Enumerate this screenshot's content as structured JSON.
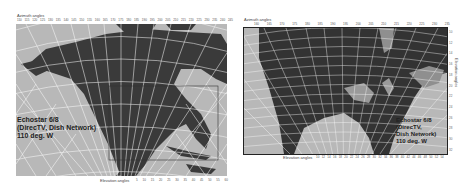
{
  "left_map": {
    "azimuth_title": "Azimuth angles",
    "azimuth_ticks": [
      "110",
      "115",
      "120",
      "125",
      "130",
      "135",
      "140",
      "145",
      "150",
      "155",
      "160",
      "165",
      "170",
      "175",
      "180",
      "185",
      "190",
      "195",
      "200",
      "205",
      "210",
      "215",
      "220",
      "225",
      "230",
      "235",
      "240",
      "245"
    ],
    "elevation_title": "Elevation angles",
    "elevation_ticks": [
      "5",
      "10",
      "15",
      "20",
      "25",
      "30",
      "35",
      "40",
      "45",
      "50",
      "55",
      "60"
    ],
    "label": {
      "line1": "Echostar 6/8",
      "line2": "(DirecTV, Dish Network)",
      "line3": "110 deg. W"
    },
    "colors": {
      "ocean": "#b8b8b8",
      "land": "#3a3a3a",
      "grid": "#ffffff",
      "box": "#333333"
    }
  },
  "right_map": {
    "azimuth_title": "Azimuth angles",
    "azimuth_ticks": [
      "160",
      "165",
      "170",
      "175",
      "180",
      "185",
      "190",
      "195",
      "200",
      "205",
      "210",
      "215",
      "220",
      "225",
      "230",
      "235"
    ],
    "elevation_title": "Elevation angles",
    "elevation_ticks": [
      "10",
      "12",
      "14",
      "16",
      "18",
      "20",
      "22",
      "24",
      "26",
      "28",
      "30",
      "32",
      "34",
      "36",
      "38",
      "40",
      "42",
      "44",
      "46",
      "48",
      "50",
      "52",
      "54"
    ],
    "label": {
      "line1": "Echostar 6/8",
      "line2": "(DirecTV,",
      "line3": "Dish Network)",
      "line4": "110 deg. W"
    },
    "colors": {
      "ocean": "#b4b4b4",
      "land": "#333333",
      "grid": "#ffffff",
      "border": "#222222"
    }
  }
}
